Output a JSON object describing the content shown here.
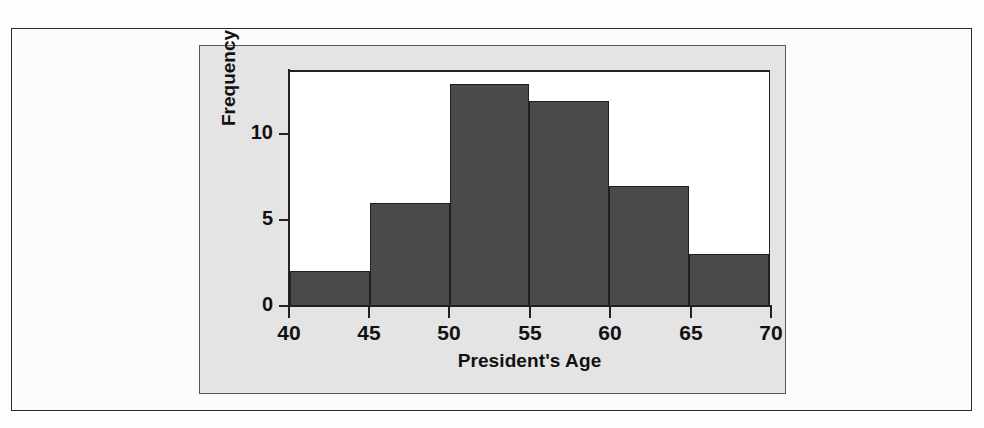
{
  "figure": {
    "panel_background": "#e4e4e4",
    "plot_background": "#ffffff",
    "frame_border_color": "#2b2b2b"
  },
  "chart_data": {
    "type": "bar",
    "subtype": "histogram",
    "title": "",
    "xlabel": "President's Age",
    "ylabel": "Frequency",
    "categories": [
      "40-45",
      "45-50",
      "50-55",
      "55-60",
      "60-65",
      "65-70"
    ],
    "bin_edges": [
      40,
      45,
      50,
      55,
      60,
      65,
      70
    ],
    "values": [
      2,
      6,
      13,
      12,
      7,
      3
    ],
    "bin_width": 5,
    "xlim": [
      40,
      70
    ],
    "ylim": [
      0,
      13.7
    ],
    "xticks": [
      "40",
      "45",
      "50",
      "55",
      "60",
      "65",
      "70"
    ],
    "yticks": [
      "0",
      "5",
      "10"
    ],
    "ytick_values": [
      0,
      5,
      10
    ],
    "grid": false,
    "legend": null,
    "bar_color": "#4a4a4a",
    "bar_edge_color": "#1f1f1f",
    "total_count": 43
  }
}
